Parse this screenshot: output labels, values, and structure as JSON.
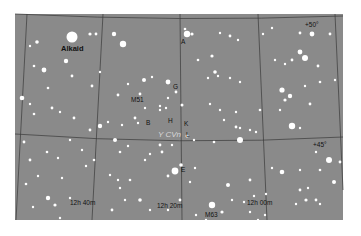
{
  "map": {
    "background": "#8a8a8a",
    "grid_color": "#3a3a3a",
    "star_color": "#ffffff",
    "area": {
      "x": 15,
      "y": 14,
      "width": 328,
      "height": 206
    }
  },
  "labels": {
    "alkaid": "Alkaid",
    "a": "A",
    "g": "G",
    "m51": "M51",
    "b": "B",
    "h": "H",
    "k": "K",
    "l": "L",
    "e": "E",
    "cvn": "Y CVn",
    "m63": "M63",
    "dec_50": "+50°",
    "dec_45": "+45°",
    "ra_12h40": "12h 40m",
    "ra_12h20": "12h 20m",
    "ra_12h00": "12h 00m"
  },
  "stars": [
    [
      72,
      37,
      5.5
    ],
    [
      123,
      44,
      3.2
    ],
    [
      114,
      34,
      2.2
    ],
    [
      90,
      34,
      1.6
    ],
    [
      96,
      34,
      1.4
    ],
    [
      66,
      61,
      2.2
    ],
    [
      44,
      70,
      2.4
    ],
    [
      37,
      42,
      1.8
    ],
    [
      34,
      66,
      1.3
    ],
    [
      30,
      46,
      1.2
    ],
    [
      72,
      76,
      1.4
    ],
    [
      100,
      72,
      1.2
    ],
    [
      92,
      86,
      1.4
    ],
    [
      48,
      88,
      1.3
    ],
    [
      22,
      98,
      2.3
    ],
    [
      30,
      104,
      1.2
    ],
    [
      52,
      108,
      1.4
    ],
    [
      60,
      112,
      1.2
    ],
    [
      34,
      114,
      1.3
    ],
    [
      187,
      34,
      3.2
    ],
    [
      192,
      34,
      1.6
    ],
    [
      185,
      29,
      1.3
    ],
    [
      220,
      33,
      1.2
    ],
    [
      230,
      36,
      1.4
    ],
    [
      238,
      40,
      1.2
    ],
    [
      263,
      34,
      1.2
    ],
    [
      272,
      28,
      1.2
    ],
    [
      300,
      33,
      1.4
    ],
    [
      312,
      34,
      2.4
    ],
    [
      330,
      34,
      1.4
    ],
    [
      300,
      52,
      2.4
    ],
    [
      305,
      58,
      3
    ],
    [
      292,
      60,
      1.4
    ],
    [
      275,
      60,
      1.2
    ],
    [
      285,
      64,
      1.2
    ],
    [
      318,
      66,
      1.4
    ],
    [
      212,
      56,
      1.6
    ],
    [
      215,
      72,
      1.8
    ],
    [
      208,
      78,
      1.2
    ],
    [
      218,
      76,
      1.2
    ],
    [
      230,
      78,
      1.2
    ],
    [
      198,
      60,
      1.3
    ],
    [
      240,
      82,
      1.2
    ],
    [
      282,
      90,
      2.6
    ],
    [
      290,
      96,
      2.2
    ],
    [
      285,
      100,
      1.6
    ],
    [
      280,
      110,
      1.2
    ],
    [
      310,
      104,
      1.4
    ],
    [
      335,
      80,
      1.2
    ],
    [
      320,
      82,
      1.3
    ],
    [
      305,
      86,
      1.2
    ],
    [
      144,
      80,
      2
    ],
    [
      152,
      77,
      1.2
    ],
    [
      140,
      94,
      1.4
    ],
    [
      128,
      84,
      1.2
    ],
    [
      118,
      95,
      1.4
    ],
    [
      168,
      82,
      2.4
    ],
    [
      176,
      92,
      1.4
    ],
    [
      168,
      98,
      1.2
    ],
    [
      182,
      105,
      1.5
    ],
    [
      160,
      106,
      1.2
    ],
    [
      145,
      108,
      1.2
    ],
    [
      135,
      118,
      1.4
    ],
    [
      122,
      125,
      1.2
    ],
    [
      138,
      123,
      1.2
    ],
    [
      100,
      126,
      2.2
    ],
    [
      108,
      122,
      1.2
    ],
    [
      160,
      110,
      1.2
    ],
    [
      166,
      108,
      1.2
    ],
    [
      90,
      130,
      1.4
    ],
    [
      74,
      118,
      1.4
    ],
    [
      160,
      145,
      1.4
    ],
    [
      172,
      145,
      1.2
    ],
    [
      187,
      136,
      1.5
    ],
    [
      194,
      140,
      1.2
    ],
    [
      214,
      142,
      1.3
    ],
    [
      236,
      127,
      1.4
    ],
    [
      240,
      128,
      1.2
    ],
    [
      256,
      132,
      1.2
    ],
    [
      292,
      126,
      3.2
    ],
    [
      300,
      128,
      1.2
    ],
    [
      240,
      140,
      3
    ],
    [
      250,
      130,
      1.2
    ],
    [
      224,
      120,
      1.2
    ],
    [
      236,
      112,
      1.2
    ],
    [
      210,
      104,
      1.2
    ],
    [
      220,
      110,
      1.2
    ],
    [
      260,
      110,
      1.3
    ],
    [
      329,
      160,
      3
    ],
    [
      340,
      162,
      1.4
    ],
    [
      316,
      152,
      1.2
    ],
    [
      282,
      172,
      2.3
    ],
    [
      272,
      168,
      1.2
    ],
    [
      300,
      170,
      1.2
    ],
    [
      320,
      170,
      1.3
    ],
    [
      334,
      182,
      2
    ],
    [
      300,
      190,
      1.4
    ],
    [
      308,
      188,
      1.2
    ],
    [
      306,
      200,
      1.6
    ],
    [
      316,
      200,
      1.4
    ],
    [
      320,
      204,
      1.2
    ],
    [
      296,
      204,
      1.2
    ],
    [
      175,
      171,
      3.4
    ],
    [
      181,
      165,
      1.8
    ],
    [
      168,
      176,
      1.4
    ],
    [
      190,
      182,
      1.2
    ],
    [
      195,
      168,
      1.2
    ],
    [
      162,
      152,
      1.4
    ],
    [
      150,
      154,
      1.2
    ],
    [
      115,
      140,
      2
    ],
    [
      120,
      152,
      1.3
    ],
    [
      128,
      146,
      1.2
    ],
    [
      145,
      160,
      1.2
    ],
    [
      130,
      180,
      1.3
    ],
    [
      110,
      175,
      1.2
    ],
    [
      118,
      180,
      1.2
    ],
    [
      120,
      188,
      1.2
    ],
    [
      140,
      200,
      1.8
    ],
    [
      150,
      210,
      1.2
    ],
    [
      125,
      200,
      1.2
    ],
    [
      112,
      210,
      1.4
    ],
    [
      118,
      222,
      1.4
    ],
    [
      47,
      152,
      1.3
    ],
    [
      30,
      160,
      1.4
    ],
    [
      24,
      142,
      1.4
    ],
    [
      58,
      158,
      1.2
    ],
    [
      38,
      176,
      1.2
    ],
    [
      26,
      184,
      1.3
    ],
    [
      48,
      198,
      2.2
    ],
    [
      55,
      205,
      1.6
    ],
    [
      33,
      207,
      1.2
    ],
    [
      70,
      198,
      1.2
    ],
    [
      40,
      222,
      1.2
    ],
    [
      60,
      218,
      1.2
    ],
    [
      62,
      178,
      1.2
    ],
    [
      86,
      166,
      1.2
    ],
    [
      94,
      160,
      1.3
    ],
    [
      82,
      150,
      1.2
    ],
    [
      70,
      140,
      1.2
    ],
    [
      212,
      205,
      3.2
    ],
    [
      222,
      212,
      1.6
    ],
    [
      232,
      200,
      1.2
    ],
    [
      196,
      215,
      1.2
    ],
    [
      206,
      220,
      1.2
    ],
    [
      244,
      202,
      1.2
    ],
    [
      254,
      196,
      1.2
    ],
    [
      265,
      215,
      1.2
    ],
    [
      228,
      185,
      2
    ],
    [
      250,
      180,
      1.4
    ],
    [
      266,
      194,
      1.2
    ],
    [
      250,
      212,
      1.2
    ],
    [
      258,
      220,
      1.2
    ],
    [
      180,
      200,
      1.4
    ],
    [
      168,
      210,
      1.2
    ]
  ]
}
